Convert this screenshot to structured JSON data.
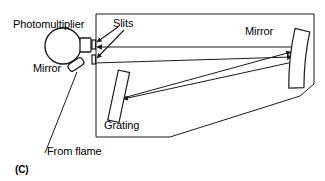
{
  "figure": {
    "panel_label": "(C)",
    "caption_type": "optical-spectrometer-schematic",
    "stroke_color": "#1a1a1a",
    "fill_color": "#ffffff",
    "background_color": "#ffffff"
  },
  "labels": {
    "photomultiplier": "Photomultiplier",
    "slits": "Slits",
    "mirror_small": "Mirror",
    "mirror_large": "Mirror",
    "grating": "Grating",
    "from_flame": "From flame"
  },
  "components": {
    "photomultiplier_tube": "photomultiplier-circle",
    "photomultiplier_window": "photomultiplier-window",
    "entrance_slit": "entrance-slit",
    "exit_slit": "exit-slit",
    "small_mirror": "small-tilted-mirror",
    "diffraction_grating": "diffraction-grating-plate",
    "collimating_mirror": "large-collimating-mirror",
    "enclosure": "monochromator-housing"
  },
  "light_rays": [
    {
      "name": "ray-mirror-to-slit",
      "direction": "leftward",
      "arrow": "left"
    },
    {
      "name": "ray-slit-to-mirror",
      "direction": "rightward",
      "arrow": "right"
    },
    {
      "name": "ray-grating-to-mirror",
      "direction": "rightward",
      "arrow": "right"
    },
    {
      "name": "ray-mirror-to-grating",
      "direction": "leftward",
      "arrow": "left"
    },
    {
      "name": "ray-from-flame",
      "direction": "upward",
      "arrow": "none"
    }
  ]
}
